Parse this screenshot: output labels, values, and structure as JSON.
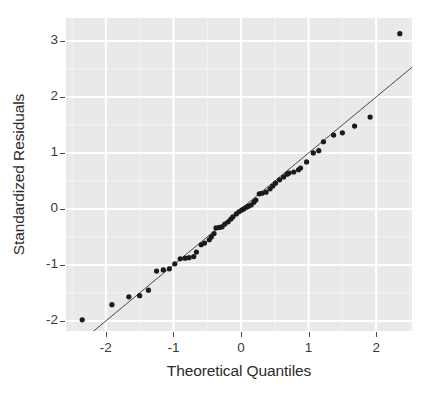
{
  "chart_data": {
    "type": "scatter",
    "title": "",
    "subtitle": "",
    "xlabel": "Theoretical Quantiles",
    "ylabel": "Standardized Residuals",
    "xlim": [
      -2.59,
      2.53
    ],
    "ylim": [
      -2.18,
      3.41
    ],
    "xticks": [
      -2,
      -1,
      0,
      1,
      2
    ],
    "xtick_labels": [
      "-2",
      "-1",
      "0",
      "1",
      "2"
    ],
    "yticks": [
      -2,
      -1,
      0,
      1,
      2,
      3
    ],
    "ytick_labels": [
      "-2",
      "-1",
      "0",
      "1",
      "2",
      "3"
    ],
    "grid": true,
    "grid_major_color": "#ffffff",
    "grid_minor_color": "#f4f4f4",
    "panel_background": "#e9e9e9",
    "point_color": "#1a1a1a",
    "point_radius": 2.6,
    "legend": null,
    "legend_position": "none",
    "reference_line": {
      "label": "qq reference line",
      "color": "#4a4a4a",
      "width": 1,
      "slope": 1.0,
      "intercept": 0.0,
      "x_start": -2.22,
      "y_start": -2.22,
      "x_end": 2.53,
      "y_end": 2.53
    },
    "series": [
      {
        "name": "Standardized residuals",
        "x": [
          -2.35,
          -1.91,
          -1.66,
          -1.5,
          -1.37,
          -1.25,
          -1.15,
          -1.06,
          -0.98,
          -0.9,
          -0.83,
          -0.77,
          -0.7,
          -0.66,
          -0.59,
          -0.54,
          -0.47,
          -0.44,
          -0.4,
          -0.37,
          -0.32,
          -0.28,
          -0.24,
          -0.19,
          -0.15,
          -0.12,
          -0.07,
          -0.03,
          0.01,
          0.04,
          0.08,
          0.11,
          0.15,
          0.19,
          0.22,
          0.27,
          0.31,
          0.37,
          0.43,
          0.47,
          0.51,
          0.57,
          0.63,
          0.68,
          0.71,
          0.78,
          0.85,
          0.88,
          0.97,
          1.07,
          1.15,
          1.22,
          1.37,
          1.5,
          1.68,
          1.91,
          2.35
        ],
        "y": [
          -1.98,
          -1.71,
          -1.57,
          -1.55,
          -1.45,
          -1.11,
          -1.09,
          -1.07,
          -0.98,
          -0.89,
          -0.88,
          -0.87,
          -0.85,
          -0.77,
          -0.64,
          -0.61,
          -0.55,
          -0.5,
          -0.44,
          -0.34,
          -0.33,
          -0.32,
          -0.27,
          -0.23,
          -0.18,
          -0.14,
          -0.09,
          -0.05,
          -0.02,
          0.0,
          0.03,
          0.05,
          0.07,
          0.12,
          0.16,
          0.27,
          0.28,
          0.3,
          0.36,
          0.41,
          0.46,
          0.52,
          0.57,
          0.62,
          0.64,
          0.66,
          0.7,
          0.73,
          0.84,
          1.0,
          1.04,
          1.2,
          1.32,
          1.36,
          1.48,
          1.64,
          3.13
        ]
      }
    ]
  },
  "axes": {
    "y_title": "Standardized Residuals",
    "x_title": "Theoretical Quantiles"
  }
}
